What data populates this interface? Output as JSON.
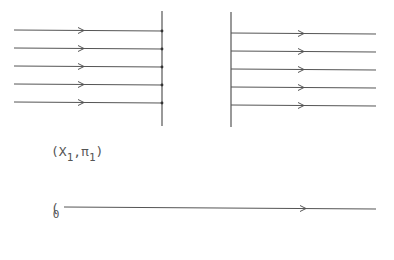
{
  "diagram": {
    "stroke_color": "#555555",
    "left_barrier": {
      "x": 162,
      "y1": 11,
      "y2": 126
    },
    "right_barrier": {
      "x": 231,
      "y1": 12,
      "y2": 127
    },
    "incoming_rays": [
      {
        "x1": 14,
        "x2": 162,
        "y": 30,
        "arrow_x": 84
      },
      {
        "x1": 14,
        "x2": 162,
        "y": 48,
        "arrow_x": 84
      },
      {
        "x1": 14,
        "x2": 162,
        "y": 66,
        "arrow_x": 84
      },
      {
        "x1": 14,
        "x2": 162,
        "y": 84,
        "arrow_x": 84
      },
      {
        "x1": 14,
        "x2": 162,
        "y": 102,
        "arrow_x": 84
      }
    ],
    "outgoing_rays": [
      {
        "x1": 231,
        "x2": 376,
        "y": 33,
        "arrow_x": 304
      },
      {
        "x1": 231,
        "x2": 376,
        "y": 51,
        "arrow_x": 304
      },
      {
        "x1": 231,
        "x2": 376,
        "y": 69,
        "arrow_x": 304
      },
      {
        "x1": 231,
        "x2": 376,
        "y": 87,
        "arrow_x": 304
      },
      {
        "x1": 231,
        "x2": 376,
        "y": 105,
        "arrow_x": 304
      }
    ],
    "bottom_ray": {
      "x1": 64,
      "x2": 376,
      "y": 208,
      "arrow_x": 306
    },
    "labels": {
      "state_label": {
        "open": "(X",
        "sub1": "1",
        "mid": ",π",
        "sub2": "1",
        "close": ")"
      },
      "origin_label": {
        "open": "(",
        "sub": "0"
      }
    }
  }
}
